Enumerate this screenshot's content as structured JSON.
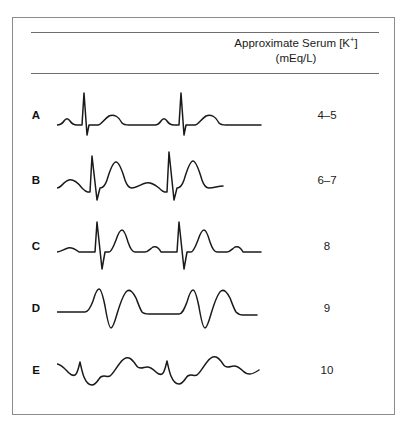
{
  "figure": {
    "header": {
      "line1_prefix": "Approximate Serum [K",
      "line1_sup": "+",
      "line1_suffix": "]",
      "line2": "(mEq/L)"
    },
    "rows": [
      {
        "label": "A",
        "value": "4–5",
        "description": "Normal sinus rhythm: small P wave, narrow tall QRS, rounded T wave",
        "path": "M0,42 C3,42 5,41 7,38 C9,35 11,35 13,38 C15,41 17,42 20,42 L24,42 L25,42 L27,10 L30,52 L32,42 L41,42 C44,42 47,36 52,33 C57,31 62,34 65,40 C67,42 69,42 72,42 L98,42 C100,42 102,41 104,38 C106,35 108,35 110,38 C112,41 114,42 117,42 L121,42 L122,42 L124,10 L127,52 L129,42 L138,42 C141,42 144,36 149,33 C154,31 159,34 162,40 C164,42 166,42 169,42 L204,42"
      },
      {
        "label": "B",
        "value": "6–7",
        "description": "Peaked T waves, hyperkalemia",
        "path": "M0,40 C4,40 7,33 12,32 C17,31 21,35 25,40 C27,42 29,44 31,44 L33,44 L35,8 L40,52 L43,40 C46,40 48,38 50,32 C53,22 56,14 59,14 C62,14 65,22 68,32 C70,38 72,40 75,40 C80,40 84,36 89,35 C94,34 98,37 102,40 C104,42 106,44 108,44 L110,44 L112,4 L117,52 L120,40 C123,40 125,38 127,32 C130,22 133,13 136,13 C139,13 142,22 145,32 C147,38 149,40 152,40 C157,40 161,38 166,38"
      },
      {
        "label": "C",
        "value": "8",
        "description": "Flattened P wave, widened QRS with deep S, peaked T",
        "path": "M0,38 C4,38 7,35 11,34 C15,33 18,35 22,38 L36,38 L38,38 L40,8 L45,55 L48,38 L52,38 C54,38 56,34 59,26 C61,20 63,16 65,16 C67,16 69,21 71,28 C73,34 75,38 78,38 L88,38 C91,38 93,35 96,33 C99,32 102,34 104,38 L118,38 L120,38 L122,8 L127,55 L130,38 L134,38 C136,38 138,34 141,26 C143,20 145,16 147,16 C149,16 151,21 153,28 C155,34 157,38 160,38 L170,38 C173,38 175,35 178,33 C181,32 184,34 186,38 L204,38"
      },
      {
        "label": "D",
        "value": "9",
        "description": "Absent P wave, markedly widened QRS, broad T merging",
        "path": "M0,36 L28,36 C31,36 33,33 36,25 C38,18 40,13 42,13 C44,13 46,20 48,30 C50,42 52,52 54,52 C56,52 58,45 60,38 C63,28 66,18 70,15 C73,13 76,16 79,22 C81,27 83,33 85,36 C87,38 89,38 92,38 L122,38 C125,38 127,34 130,26 C132,19 134,14 136,14 C138,14 140,21 142,31 C144,43 146,52 148,52 C150,52 152,45 154,38 C157,28 160,18 164,15 C167,13 170,16 173,22 C175,27 177,33 179,36 C181,38 183,39 186,39 L200,39"
      },
      {
        "label": "E",
        "value": "10",
        "description": "Sine wave pattern: QRS merges with T wave",
        "path": "M0,26 C4,26 8,31 12,35 C14,37 16,38 18,37 C20,36 21,32 22,28 L23,24 C24,28 25,34 27,39 C29,44 32,47 35,47 C38,47 40,44 42,41 C43,39 45,38 47,38 C49,38 51,39 53,38 C56,36 59,30 63,25 C66,21 69,19 72,20 C75,21 77,24 79,27 C80,29 82,30 84,30 C86,30 88,29 90,29 C93,29 96,31 99,34 C101,36 103,37 105,36 C107,35 108,31 109,27 L110,23 C111,27 112,33 114,38 C116,43 119,46 122,46 C125,46 127,43 129,40 C130,38 132,37 134,37 C136,37 138,38 140,37 C143,35 146,29 150,24 C153,20 156,18 159,19 C162,20 164,23 166,26 C167,28 169,29 171,29 C173,29 175,28 177,28 C180,28 183,30 186,33 C188,35 190,36 193,36 C196,36 199,34 202,32"
      }
    ]
  }
}
